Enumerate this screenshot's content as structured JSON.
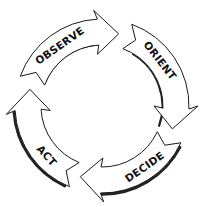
{
  "diagram": {
    "center": [
      102,
      106
    ],
    "outer_radius": 87,
    "inner_radius": 61,
    "colors": {
      "fill": "#ffffff",
      "stroke": "#1a1a1a",
      "shadow": "#222222",
      "text": "#111111"
    },
    "segments": [
      {
        "label": "OBSERVE",
        "start_deg": 200,
        "end_deg": 283,
        "label_deg": 235,
        "shadow": "inner"
      },
      {
        "label": "ORIENT",
        "start_deg": 290,
        "end_deg": 18,
        "label_deg": 322,
        "shadow": "none"
      },
      {
        "label": "DECIDE",
        "start_deg": 25,
        "end_deg": 107,
        "label_deg": 55,
        "shadow": "outer"
      },
      {
        "label": "ACT",
        "start_deg": 112,
        "end_deg": 193,
        "label_deg": 138,
        "shadow": "outer"
      }
    ]
  }
}
